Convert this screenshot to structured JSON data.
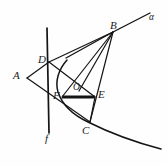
{
  "figure": {
    "background_color": "#fefefe",
    "stroke_color": "#141414",
    "canvas": {
      "width": 167,
      "height": 166
    },
    "labels": [
      {
        "id": "alpha",
        "text": "α",
        "x": 149,
        "y": 13,
        "style": "small"
      },
      {
        "id": "B",
        "text": "B",
        "x": 110,
        "y": 20,
        "style": ""
      },
      {
        "id": "D",
        "text": "D",
        "x": 38,
        "y": 54,
        "style": ""
      },
      {
        "id": "A",
        "text": "A",
        "x": 13,
        "y": 70,
        "style": ""
      },
      {
        "id": "O",
        "text": "O",
        "x": 73,
        "y": 83,
        "style": "small"
      },
      {
        "id": "E",
        "text": "E",
        "x": 98,
        "y": 89,
        "style": ""
      },
      {
        "id": "F",
        "text": "F",
        "x": 53,
        "y": 90,
        "style": ""
      },
      {
        "id": "C",
        "text": "C",
        "x": 82,
        "y": 125,
        "style": ""
      },
      {
        "id": "f",
        "text": "f",
        "x": 45,
        "y": 133,
        "style": ""
      }
    ],
    "points": {
      "A": {
        "x": 27,
        "y": 78
      },
      "B": {
        "x": 113,
        "y": 32
      },
      "C": {
        "x": 90,
        "y": 122
      },
      "D": {
        "x": 49,
        "y": 62
      },
      "E": {
        "x": 95,
        "y": 97
      },
      "F": {
        "x": 62,
        "y": 97
      },
      "O": {
        "x": 79,
        "y": 91
      }
    },
    "elements": [
      {
        "name": "conic-curve",
        "kind": "curve",
        "desc": "smooth arc through F, C extending to lower right"
      },
      {
        "name": "line-alpha",
        "kind": "line",
        "desc": "ray alpha through B to upper right"
      },
      {
        "name": "line-f",
        "kind": "line",
        "desc": "vertical line f through D and F"
      },
      {
        "name": "segment-FE",
        "kind": "thick-segment",
        "desc": "bold segment F to E through O"
      },
      {
        "name": "segment-AD",
        "kind": "line",
        "desc": "A to D"
      },
      {
        "name": "segment-AC",
        "kind": "line",
        "desc": "A downward right toward C"
      },
      {
        "name": "segment-DB",
        "kind": "line",
        "desc": "D to B"
      },
      {
        "name": "segment-OB",
        "kind": "line",
        "desc": "O to B"
      },
      {
        "name": "segment-FB",
        "kind": "line",
        "desc": "F to B"
      },
      {
        "name": "segment-CB",
        "kind": "line",
        "desc": "C to B"
      },
      {
        "name": "segment-DE",
        "kind": "line",
        "desc": "D through O to E"
      },
      {
        "name": "segment-EC",
        "kind": "line",
        "desc": "E to C"
      }
    ]
  }
}
